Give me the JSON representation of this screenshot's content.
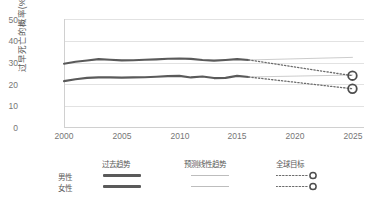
{
  "chart_data": {
    "type": "line",
    "title": "",
    "xlabel": "",
    "ylabel": "过早死亡的概率(%)",
    "xlim": [
      2000,
      2026
    ],
    "ylim": [
      0,
      50
    ],
    "grid": true,
    "x_ticks": [
      "2000",
      "2005",
      "2010",
      "2015",
      "2020",
      "2025"
    ],
    "y_ticks": [
      "0",
      "10",
      "20",
      "30",
      "40",
      "50"
    ],
    "legend_position": "bottom",
    "series": [
      {
        "name": "男性 — 过去趋势",
        "sex": "男性",
        "kind": "past-trend",
        "style": "solid-thick",
        "color": "#5a5a5a",
        "x": [
          2000,
          2001,
          2002,
          2003,
          2004,
          2005,
          2006,
          2007,
          2008,
          2009,
          2010,
          2011,
          2012,
          2013,
          2014,
          2015,
          2016
        ],
        "values": [
          29.5,
          30.4,
          31.0,
          31.6,
          31.3,
          31.0,
          31.1,
          31.3,
          31.5,
          31.8,
          31.9,
          31.7,
          31.2,
          30.9,
          31.2,
          31.6,
          31.2
        ]
      },
      {
        "name": "女性 — 过去趋势",
        "sex": "女性",
        "kind": "past-trend",
        "style": "solid-thick",
        "color": "#5a5a5a",
        "x": [
          2000,
          2001,
          2002,
          2003,
          2004,
          2005,
          2006,
          2007,
          2008,
          2009,
          2010,
          2011,
          2012,
          2013,
          2014,
          2015,
          2016
        ],
        "values": [
          21.5,
          22.4,
          23.0,
          23.2,
          23.2,
          23.1,
          23.2,
          23.3,
          23.5,
          23.8,
          23.9,
          23.2,
          23.6,
          22.9,
          23.0,
          23.9,
          23.4
        ]
      },
      {
        "name": "男性 — 预测线性趋势",
        "sex": "男性",
        "kind": "projected-linear",
        "style": "solid-thin",
        "color": "#c6c6c6",
        "x": [
          2016,
          2025
        ],
        "values": [
          31.2,
          32.4
        ]
      },
      {
        "name": "女性 — 预测线性趋势",
        "sex": "女性",
        "kind": "projected-linear",
        "style": "solid-thin",
        "color": "#c6c6c6",
        "x": [
          2016,
          2025
        ],
        "values": [
          23.4,
          24.3
        ]
      },
      {
        "name": "男性 — 全球目标",
        "sex": "男性",
        "kind": "global-target",
        "style": "dotted",
        "color": "#6b6b6b",
        "x": [
          2016,
          2025
        ],
        "values": [
          31.2,
          24.0
        ],
        "marker": {
          "shape": "circle",
          "x": 2025,
          "value": 24.0
        }
      },
      {
        "name": "女性 — 全球目标",
        "sex": "女性",
        "kind": "global-target",
        "style": "dotted",
        "color": "#6b6b6b",
        "x": [
          2016,
          2025
        ],
        "values": [
          23.4,
          18.0
        ],
        "marker": {
          "shape": "circle",
          "x": 2025,
          "value": 18.0
        }
      }
    ]
  },
  "legend": {
    "columns": [
      {
        "key": "past",
        "label": "过去趋势"
      },
      {
        "key": "projected",
        "label": "预测线性趋势"
      },
      {
        "key": "target",
        "label": "全球目标"
      }
    ],
    "rows": [
      {
        "key": "male",
        "label": "男性"
      },
      {
        "key": "female",
        "label": "女性"
      }
    ]
  },
  "colors": {
    "past_trend": "#5a5a5a",
    "projected_trend": "#c6c6c6",
    "target": "#6b6b6b",
    "gridline": "#e2e2e2",
    "tick_text": "#767676",
    "axis_title": "#595959"
  }
}
